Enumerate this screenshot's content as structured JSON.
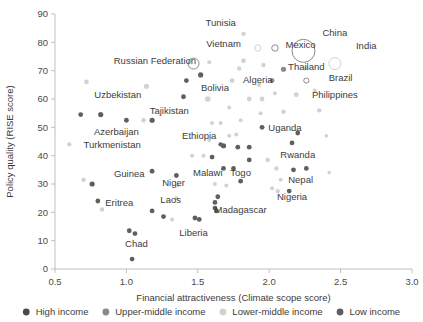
{
  "chart_data": {
    "type": "scatter",
    "title": "",
    "xlabel": "Financial attractiveness (Climate scope score)",
    "ylabel": "Policy quality (RISE score)",
    "xlim": [
      0.5,
      3.0
    ],
    "ylim": [
      0,
      90
    ],
    "xticks": [
      "0.5",
      "1.0",
      "1.5",
      "2.0",
      "2.5",
      "3.0"
    ],
    "yticks": [
      "0",
      "10",
      "20",
      "30",
      "40",
      "50",
      "60",
      "70",
      "80",
      "90"
    ],
    "grid": false,
    "legend_position": "bottom",
    "colors": {
      "high_income": "#4a4a4a",
      "upper_middle_income": "#8a8a8a",
      "lower_middle_income": "#d2d2d2",
      "low_income": "#5f5f5f",
      "axis": "#b9b9b9",
      "text": "#3b3b3b"
    },
    "legend": [
      {
        "label": "High income",
        "key": "high_income"
      },
      {
        "label": "Upper-middle income",
        "key": "upper_middle_income"
      },
      {
        "label": "Lower-middle income",
        "key": "lower_middle_income"
      },
      {
        "label": "Low income",
        "key": "low_income"
      }
    ],
    "points": [
      {
        "name": "China",
        "x": 2.24,
        "y": 77.0,
        "group": "upper_middle_income",
        "r": 11.5,
        "open": true,
        "label": "China",
        "lx": 2.46,
        "ly": 83.5,
        "anchor": "middle"
      },
      {
        "name": "India",
        "x": 2.46,
        "y": 72.5,
        "group": "lower_middle_income",
        "r": 6.0,
        "open": true,
        "label": "India",
        "lx": 2.68,
        "ly": 79.0,
        "anchor": "middle"
      },
      {
        "name": "Tunisia",
        "x": 1.82,
        "y": 83.0,
        "group": "lower_middle_income",
        "r": 2.2,
        "open": false,
        "label": "Tunisia",
        "lx": 1.66,
        "ly": 87.0,
        "anchor": "middle"
      },
      {
        "name": "Vietnam",
        "x": 1.92,
        "y": 78.0,
        "group": "lower_middle_income",
        "r": 3.2,
        "open": true,
        "label": "Vietnam",
        "lx": 1.68,
        "ly": 79.5,
        "anchor": "middle"
      },
      {
        "name": "Mexico",
        "x": 2.04,
        "y": 78.0,
        "group": "upper_middle_income",
        "r": 3.2,
        "open": true,
        "label": "Mexico",
        "lx": 2.22,
        "ly": 79.3,
        "anchor": "middle"
      },
      {
        "name": "Russian Federation",
        "x": 1.47,
        "y": 72.5,
        "group": "upper_middle_income",
        "r": 5.5,
        "open": true,
        "label": "Russian Federation",
        "lx": 1.2,
        "ly": 73.5,
        "anchor": "middle"
      },
      {
        "name": "Thailand",
        "x": 2.1,
        "y": 70.5,
        "group": "upper_middle_income",
        "r": 2.6,
        "open": false,
        "label": "Thailand",
        "lx": 2.26,
        "ly": 71.5,
        "anchor": "middle"
      },
      {
        "name": "Brazil",
        "x": 2.26,
        "y": 66.5,
        "group": "upper_middle_income",
        "r": 2.6,
        "open": true,
        "label": "Brazil",
        "lx": 2.5,
        "ly": 67.5,
        "anchor": "middle"
      },
      {
        "name": "Philippines",
        "x": 2.19,
        "y": 61.5,
        "group": "lower_middle_income",
        "r": 2.4,
        "open": false,
        "label": "Philippines",
        "lx": 2.46,
        "ly": 61.5,
        "anchor": "middle"
      },
      {
        "name": "Algeria",
        "x": 1.74,
        "y": 66.5,
        "group": "lower_middle_income",
        "r": 2.4,
        "open": false,
        "label": "Algeria",
        "lx": 1.92,
        "ly": 66.8,
        "anchor": "middle"
      },
      {
        "name": "Bolivia",
        "x": 1.57,
        "y": 60.0,
        "group": "lower_middle_income",
        "r": 2.8,
        "open": false,
        "label": "Bolivia",
        "lx": 1.62,
        "ly": 64.0,
        "anchor": "middle"
      },
      {
        "name": "Uzbekistan",
        "x": 1.14,
        "y": 64.5,
        "group": "lower_middle_income",
        "r": 2.6,
        "open": false,
        "label": "Uzbekistan",
        "lx": 0.94,
        "ly": 61.5,
        "anchor": "middle"
      },
      {
        "name": "Tajikistan",
        "x": 1.18,
        "y": 52.5,
        "group": "low_income",
        "r": 2.6,
        "open": false,
        "label": "Tajikistan",
        "lx": 1.3,
        "ly": 56.0,
        "anchor": "middle"
      },
      {
        "name": "Azerbaijan",
        "x": 0.82,
        "y": 54.5,
        "group": "low_income",
        "r": 2.6,
        "open": false,
        "label": "Azerbaijan",
        "lx": 0.93,
        "ly": 48.5,
        "anchor": "middle"
      },
      {
        "name": "Turkmenistan",
        "x": 0.6,
        "y": 44.0,
        "group": "lower_middle_income",
        "r": 2.2,
        "open": false,
        "label": "Turkmenistan",
        "lx": 0.9,
        "ly": 44.0,
        "anchor": "middle"
      },
      {
        "name": "Ethiopia",
        "x": 1.68,
        "y": 43.5,
        "group": "low_income",
        "r": 2.6,
        "open": false,
        "label": "Ethiopia",
        "lx": 1.51,
        "ly": 47.0,
        "anchor": "middle"
      },
      {
        "name": "Uganda",
        "x": 1.95,
        "y": 50.0,
        "group": "low_income",
        "r": 2.4,
        "open": false,
        "label": "Uganda",
        "lx": 2.11,
        "ly": 50.0,
        "anchor": "middle"
      },
      {
        "name": "Rwanda",
        "x": 2.16,
        "y": 44.5,
        "group": "low_income",
        "r": 2.4,
        "open": false,
        "label": "Rwanda",
        "lx": 2.2,
        "ly": 40.5,
        "anchor": "middle"
      },
      {
        "name": "Malawi",
        "x": 1.68,
        "y": 35.5,
        "group": "low_income",
        "r": 2.4,
        "open": false,
        "label": "Malawi",
        "lx": 1.57,
        "ly": 34.0,
        "anchor": "middle"
      },
      {
        "name": "Togo",
        "x": 1.75,
        "y": 35.5,
        "group": "low_income",
        "r": 2.4,
        "open": false,
        "label": "Togo",
        "lx": 1.8,
        "ly": 34.0,
        "anchor": "middle"
      },
      {
        "name": "Nepal",
        "x": 2.17,
        "y": 35.0,
        "group": "low_income",
        "r": 2.4,
        "open": false,
        "label": "Nepal",
        "lx": 2.22,
        "ly": 31.5,
        "anchor": "middle"
      },
      {
        "name": "Nigeria",
        "x": 2.06,
        "y": 27.5,
        "group": "lower_middle_income",
        "r": 2.2,
        "open": false,
        "label": "Nigeria",
        "lx": 2.16,
        "ly": 25.5,
        "anchor": "middle"
      },
      {
        "name": "Niger",
        "x": 1.35,
        "y": 33.0,
        "group": "low_income",
        "r": 2.4,
        "open": false,
        "label": "Niger",
        "lx": 1.33,
        "ly": 30.5,
        "anchor": "middle"
      },
      {
        "name": "Guinea",
        "x": 1.18,
        "y": 34.5,
        "group": "low_income",
        "r": 2.4,
        "open": false,
        "label": "Guinea",
        "lx": 1.02,
        "ly": 33.5,
        "anchor": "middle"
      },
      {
        "name": "Eritrea",
        "x": 0.8,
        "y": 24.0,
        "group": "low_income",
        "r": 2.4,
        "open": false,
        "label": "Eritrea",
        "lx": 0.95,
        "ly": 23.5,
        "anchor": "middle"
      },
      {
        "name": "Laos",
        "x": 1.35,
        "y": 25.0,
        "group": "lower_middle_income",
        "r": 2.2,
        "open": false,
        "label": "Laos",
        "lx": 1.31,
        "ly": 24.5,
        "anchor": "middle"
      },
      {
        "name": "Liberia",
        "x": 1.48,
        "y": 18.0,
        "group": "low_income",
        "r": 2.4,
        "open": false,
        "label": "Liberia",
        "lx": 1.47,
        "ly": 13.0,
        "anchor": "middle"
      },
      {
        "name": "Madagascar",
        "x": 1.62,
        "y": 21.5,
        "group": "low_income",
        "r": 2.4,
        "open": false,
        "label": "Madagascar",
        "lx": 1.8,
        "ly": 21.0,
        "anchor": "middle"
      },
      {
        "name": "Chad",
        "x": 1.02,
        "y": 13.5,
        "group": "low_income",
        "r": 2.4,
        "open": false,
        "label": "Chad",
        "lx": 1.07,
        "ly": 9.0,
        "anchor": "middle"
      },
      {
        "name": "unlabeled-1",
        "x": 0.72,
        "y": 66.0,
        "group": "lower_middle_income",
        "r": 2.4,
        "open": false,
        "label": ""
      },
      {
        "name": "unlabeled-2",
        "x": 0.68,
        "y": 54.5,
        "group": "low_income",
        "r": 2.4,
        "open": false,
        "label": ""
      },
      {
        "name": "unlabeled-3",
        "x": 1.0,
        "y": 52.5,
        "group": "low_income",
        "r": 2.4,
        "open": false,
        "label": ""
      },
      {
        "name": "unlabeled-4",
        "x": 1.12,
        "y": 52.5,
        "group": "lower_middle_income",
        "r": 2.2,
        "open": false,
        "label": ""
      },
      {
        "name": "unlabeled-5",
        "x": 1.42,
        "y": 66.5,
        "group": "low_income",
        "r": 2.4,
        "open": false,
        "label": ""
      },
      {
        "name": "unlabeled-6",
        "x": 1.4,
        "y": 60.8,
        "group": "low_income",
        "r": 2.4,
        "open": false,
        "label": ""
      },
      {
        "name": "unlabeled-7",
        "x": 1.52,
        "y": 68.5,
        "group": "low_income",
        "r": 2.6,
        "open": false,
        "label": ""
      },
      {
        "name": "unlabeled-8",
        "x": 1.79,
        "y": 70.8,
        "group": "lower_middle_income",
        "r": 2.2,
        "open": false,
        "label": ""
      },
      {
        "name": "unlabeled-9",
        "x": 1.93,
        "y": 65.0,
        "group": "lower_middle_income",
        "r": 2.2,
        "open": false,
        "label": ""
      },
      {
        "name": "unlabeled-10",
        "x": 2.02,
        "y": 66.5,
        "group": "upper_middle_income",
        "r": 2.4,
        "open": false,
        "label": ""
      },
      {
        "name": "unlabeled-11",
        "x": 2.35,
        "y": 56.0,
        "group": "lower_middle_income",
        "r": 2.2,
        "open": false,
        "label": ""
      },
      {
        "name": "unlabeled-12",
        "x": 2.26,
        "y": 70.8,
        "group": "lower_middle_income",
        "r": 2.2,
        "open": false,
        "label": ""
      },
      {
        "name": "unlabeled-13",
        "x": 1.96,
        "y": 72.0,
        "group": "lower_middle_income",
        "r": 2.2,
        "open": false,
        "label": ""
      },
      {
        "name": "unlabeled-14",
        "x": 1.82,
        "y": 73.5,
        "group": "lower_middle_income",
        "r": 2.4,
        "open": false,
        "label": ""
      },
      {
        "name": "unlabeled-15",
        "x": 1.86,
        "y": 60.0,
        "group": "lower_middle_income",
        "r": 2.4,
        "open": false,
        "label": ""
      },
      {
        "name": "unlabeled-16",
        "x": 1.95,
        "y": 60.0,
        "group": "lower_middle_income",
        "r": 2.4,
        "open": false,
        "label": ""
      },
      {
        "name": "unlabeled-17",
        "x": 2.1,
        "y": 55.5,
        "group": "lower_middle_income",
        "r": 2.2,
        "open": false,
        "label": ""
      },
      {
        "name": "unlabeled-18",
        "x": 2.2,
        "y": 48.0,
        "group": "low_income",
        "r": 2.4,
        "open": false,
        "label": ""
      },
      {
        "name": "unlabeled-19",
        "x": 1.72,
        "y": 57.0,
        "group": "lower_middle_income",
        "r": 2.0,
        "open": false,
        "label": ""
      },
      {
        "name": "unlabeled-20",
        "x": 1.8,
        "y": 52.5,
        "group": "lower_middle_income",
        "r": 2.0,
        "open": false,
        "label": ""
      },
      {
        "name": "unlabeled-21",
        "x": 1.6,
        "y": 51.5,
        "group": "lower_middle_income",
        "r": 2.0,
        "open": false,
        "label": ""
      },
      {
        "name": "unlabeled-22",
        "x": 1.66,
        "y": 51.5,
        "group": "lower_middle_income",
        "r": 2.0,
        "open": false,
        "label": ""
      },
      {
        "name": "unlabeled-23",
        "x": 1.78,
        "y": 43.0,
        "group": "low_income",
        "r": 2.4,
        "open": false,
        "label": ""
      },
      {
        "name": "unlabeled-24",
        "x": 1.86,
        "y": 43.0,
        "group": "low_income",
        "r": 2.4,
        "open": false,
        "label": ""
      },
      {
        "name": "unlabeled-25",
        "x": 1.6,
        "y": 39.5,
        "group": "low_income",
        "r": 2.4,
        "open": false,
        "label": ""
      },
      {
        "name": "unlabeled-26",
        "x": 1.86,
        "y": 38.5,
        "group": "low_income",
        "r": 2.4,
        "open": false,
        "label": ""
      },
      {
        "name": "unlabeled-27",
        "x": 1.99,
        "y": 38.5,
        "group": "lower_middle_income",
        "r": 2.2,
        "open": false,
        "label": ""
      },
      {
        "name": "unlabeled-28",
        "x": 2.05,
        "y": 35.5,
        "group": "lower_middle_income",
        "r": 2.2,
        "open": false,
        "label": ""
      },
      {
        "name": "unlabeled-29",
        "x": 2.26,
        "y": 35.5,
        "group": "low_income",
        "r": 2.4,
        "open": false,
        "label": ""
      },
      {
        "name": "unlabeled-30",
        "x": 2.08,
        "y": 31.5,
        "group": "lower_middle_income",
        "r": 2.0,
        "open": false,
        "label": ""
      },
      {
        "name": "unlabeled-31",
        "x": 2.14,
        "y": 27.5,
        "group": "low_income",
        "r": 2.4,
        "open": false,
        "label": ""
      },
      {
        "name": "unlabeled-32",
        "x": 2.02,
        "y": 28.5,
        "group": "lower_middle_income",
        "r": 2.0,
        "open": false,
        "label": ""
      },
      {
        "name": "unlabeled-33",
        "x": 1.8,
        "y": 31.0,
        "group": "low_income",
        "r": 2.4,
        "open": false,
        "label": ""
      },
      {
        "name": "unlabeled-34",
        "x": 1.62,
        "y": 30.0,
        "group": "lower_middle_income",
        "r": 2.0,
        "open": false,
        "label": ""
      },
      {
        "name": "unlabeled-35",
        "x": 1.7,
        "y": 29.5,
        "group": "lower_middle_income",
        "r": 2.0,
        "open": false,
        "label": ""
      },
      {
        "name": "unlabeled-36",
        "x": 1.36,
        "y": 29.5,
        "group": "lower_middle_income",
        "r": 2.0,
        "open": false,
        "label": ""
      },
      {
        "name": "unlabeled-37",
        "x": 1.18,
        "y": 20.5,
        "group": "low_income",
        "r": 2.4,
        "open": false,
        "label": ""
      },
      {
        "name": "unlabeled-38",
        "x": 1.26,
        "y": 18.5,
        "group": "low_income",
        "r": 2.4,
        "open": false,
        "label": ""
      },
      {
        "name": "unlabeled-39",
        "x": 1.32,
        "y": 17.5,
        "group": "lower_middle_income",
        "r": 2.0,
        "open": false,
        "label": ""
      },
      {
        "name": "unlabeled-40",
        "x": 1.51,
        "y": 17.5,
        "group": "low_income",
        "r": 2.4,
        "open": false,
        "label": ""
      },
      {
        "name": "unlabeled-41",
        "x": 1.63,
        "y": 20.5,
        "group": "low_income",
        "r": 2.4,
        "open": false,
        "label": ""
      },
      {
        "name": "unlabeled-42",
        "x": 1.62,
        "y": 23.5,
        "group": "low_income",
        "r": 2.4,
        "open": false,
        "label": ""
      },
      {
        "name": "unlabeled-43",
        "x": 1.64,
        "y": 25.5,
        "group": "low_income",
        "r": 2.4,
        "open": false,
        "label": ""
      },
      {
        "name": "unlabeled-44",
        "x": 1.06,
        "y": 12.5,
        "group": "low_income",
        "r": 2.4,
        "open": false,
        "label": ""
      },
      {
        "name": "unlabeled-45",
        "x": 1.04,
        "y": 3.5,
        "group": "low_income",
        "r": 2.4,
        "open": false,
        "label": ""
      },
      {
        "name": "unlabeled-46",
        "x": 0.7,
        "y": 31.5,
        "group": "lower_middle_income",
        "r": 2.2,
        "open": false,
        "label": ""
      },
      {
        "name": "unlabeled-47",
        "x": 0.76,
        "y": 30.0,
        "group": "low_income",
        "r": 2.6,
        "open": false,
        "label": ""
      },
      {
        "name": "unlabeled-48",
        "x": 0.83,
        "y": 21.0,
        "group": "lower_middle_income",
        "r": 2.2,
        "open": false,
        "label": ""
      },
      {
        "name": "unlabeled-49",
        "x": 1.46,
        "y": 40.0,
        "group": "lower_middle_income",
        "r": 2.0,
        "open": false,
        "label": ""
      },
      {
        "name": "unlabeled-50",
        "x": 1.54,
        "y": 40.0,
        "group": "lower_middle_income",
        "r": 2.0,
        "open": false,
        "label": ""
      },
      {
        "name": "unlabeled-51",
        "x": 1.72,
        "y": 47.0,
        "group": "lower_middle_income",
        "r": 2.0,
        "open": false,
        "label": ""
      },
      {
        "name": "unlabeled-52",
        "x": 2.32,
        "y": 63.0,
        "group": "lower_middle_income",
        "r": 2.0,
        "open": false,
        "label": ""
      },
      {
        "name": "unlabeled-53",
        "x": 2.04,
        "y": 62.0,
        "group": "lower_middle_income",
        "r": 2.0,
        "open": false,
        "label": ""
      },
      {
        "name": "unlabeled-54",
        "x": 1.77,
        "y": 47.5,
        "group": "lower_middle_income",
        "r": 2.0,
        "open": false,
        "label": ""
      },
      {
        "name": "unlabeled-55",
        "x": 2.4,
        "y": 47.0,
        "group": "lower_middle_income",
        "r": 1.8,
        "open": false,
        "label": ""
      },
      {
        "name": "unlabeled-56",
        "x": 1.58,
        "y": 45.5,
        "group": "lower_middle_income",
        "r": 2.0,
        "open": false,
        "label": ""
      },
      {
        "name": "unlabeled-57",
        "x": 1.94,
        "y": 55.0,
        "group": "lower_middle_income",
        "r": 2.0,
        "open": false,
        "label": ""
      },
      {
        "name": "unlabeled-58",
        "x": 2.42,
        "y": 34.0,
        "group": "lower_middle_income",
        "r": 1.8,
        "open": false,
        "label": ""
      },
      {
        "name": "unlabeled-59",
        "x": 1.58,
        "y": 73.0,
        "group": "lower_middle_income",
        "r": 2.0,
        "open": false,
        "label": ""
      },
      {
        "name": "unlabeled-60",
        "x": 1.66,
        "y": 44.0,
        "group": "low_income",
        "r": 2.2,
        "open": false,
        "label": ""
      }
    ]
  }
}
